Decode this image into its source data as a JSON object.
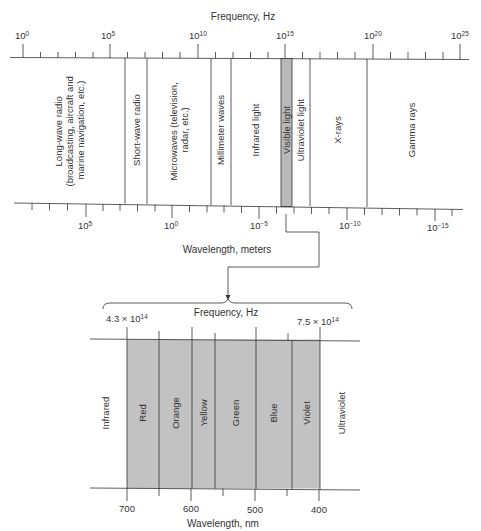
{
  "colors": {
    "line": "#333333",
    "visible_fill": "#b9b9b9",
    "spectrum_fill": "#c2c2c2",
    "background": "#ffffff"
  },
  "top_axis": {
    "title": "Frequency, Hz",
    "ticks": [
      {
        "base": "10",
        "exp": "0"
      },
      {
        "base": "10",
        "exp": "5"
      },
      {
        "base": "10",
        "exp": "10"
      },
      {
        "base": "10",
        "exp": "15"
      },
      {
        "base": "10",
        "exp": "20"
      },
      {
        "base": "10",
        "exp": "25"
      }
    ]
  },
  "bands": [
    {
      "label_lines": [
        "Long-wave radio",
        "(broadcasting, aircraft and",
        "marine navigation, etc.)"
      ]
    },
    {
      "label_lines": [
        "Short-wave radio"
      ]
    },
    {
      "label_lines": [
        "Microwaves (television,",
        "radar, etc.)"
      ]
    },
    {
      "label_lines": [
        "Millimeter waves"
      ]
    },
    {
      "label_lines": [
        "Infrared light"
      ]
    },
    {
      "label_lines": [
        "Visible light"
      ]
    },
    {
      "label_lines": [
        "Ultraviolet light"
      ]
    },
    {
      "label_lines": [
        "X-rays"
      ]
    },
    {
      "label_lines": [
        "Gamma rays"
      ]
    }
  ],
  "bottom_axis": {
    "title": "Wavelength, meters",
    "ticks": [
      {
        "base": "10",
        "exp": "5"
      },
      {
        "base": "10",
        "exp": "0"
      },
      {
        "base": "10",
        "exp": "−5"
      },
      {
        "base": "10",
        "exp": "−10"
      },
      {
        "base": "10",
        "exp": "−15"
      }
    ]
  },
  "visible_detail": {
    "freq_title": "Frequency, Hz",
    "freq_left": {
      "mant": "4.3 × 10",
      "exp": "14"
    },
    "freq_right": {
      "mant": "7.5 × 10",
      "exp": "14"
    },
    "left_label": "Infrared",
    "right_label": "Ultraviolet",
    "colors": [
      "Red",
      "Orange",
      "Yellow",
      "Green",
      "Blue",
      "Violet"
    ],
    "wavelength_title": "Wavelength, nm",
    "wavelength_ticks": [
      "700",
      "600",
      "500",
      "400"
    ]
  }
}
